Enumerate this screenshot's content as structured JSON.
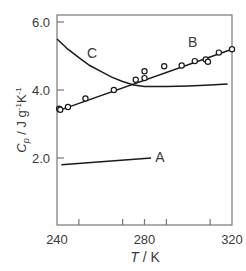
{
  "chart_data": {
    "type": "line",
    "title": "",
    "xlabel": "T / K",
    "xlabel_italic_part": "T",
    "xlabel_unit": " / K",
    "ylabel": "Cp / J g-1 K-1",
    "ylabel_symbol": "C",
    "ylabel_sub": "p",
    "ylabel_unit": " / J g",
    "ylabel_exp1": "-1",
    "ylabel_k": "K",
    "ylabel_exp2": "-1",
    "xlim": [
      240,
      320
    ],
    "ylim": [
      0.0,
      6.2
    ],
    "x_ticks": [
      240,
      250,
      260,
      270,
      280,
      290,
      300,
      310,
      320
    ],
    "x_tick_labels": [
      "240",
      "280",
      "320"
    ],
    "x_tick_label_values": [
      240,
      280,
      320
    ],
    "y_ticks": [
      2.0,
      4.0,
      6.0
    ],
    "y_tick_labels": [
      "2.0",
      "4.0",
      "6.0"
    ],
    "grid": false,
    "legend": "inline labels",
    "series": [
      {
        "name": "A",
        "style": "line",
        "x": [
          242,
          283
        ],
        "y": [
          1.8,
          2.0
        ],
        "label_pos": {
          "x": 287,
          "y": 2.02
        }
      },
      {
        "name": "B",
        "style": "line+markers",
        "x": [
          241,
          320
        ],
        "y": [
          3.4,
          5.2
        ],
        "points": [
          {
            "x": 241,
            "y": 3.45
          },
          {
            "x": 241.5,
            "y": 3.42
          },
          {
            "x": 245,
            "y": 3.5
          },
          {
            "x": 253,
            "y": 3.75
          },
          {
            "x": 266,
            "y": 4.0
          },
          {
            "x": 276,
            "y": 4.3
          },
          {
            "x": 280,
            "y": 4.35
          },
          {
            "x": 280,
            "y": 4.55
          },
          {
            "x": 289,
            "y": 4.7
          },
          {
            "x": 297,
            "y": 4.72
          },
          {
            "x": 303,
            "y": 4.85
          },
          {
            "x": 308,
            "y": 4.9
          },
          {
            "x": 309,
            "y": 4.83
          },
          {
            "x": 314,
            "y": 5.1
          },
          {
            "x": 320,
            "y": 5.2
          }
        ],
        "label_pos": {
          "x": 302,
          "y": 5.4
        }
      },
      {
        "name": "C",
        "style": "line",
        "x": [
          240,
          245,
          250,
          255,
          260,
          265,
          270,
          275,
          280,
          290,
          300,
          310,
          318
        ],
        "y": [
          5.5,
          5.2,
          4.95,
          4.72,
          4.55,
          4.38,
          4.25,
          4.15,
          4.1,
          4.1,
          4.12,
          4.15,
          4.18
        ],
        "label_pos": {
          "x": 256,
          "y": 5.1
        }
      }
    ]
  }
}
